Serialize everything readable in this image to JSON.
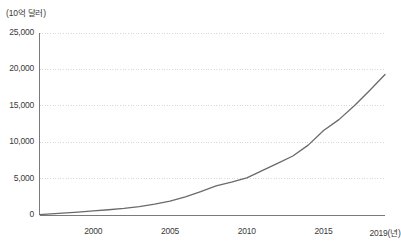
{
  "chart_data": {
    "type": "line",
    "title": "",
    "subtitle": "",
    "unit_label": "(10억 달러)",
    "xlabel": "2019(년)",
    "ylabel": "(10억 달러)",
    "xlim": [
      1996.5,
      2019
    ],
    "ylim": [
      0,
      25000
    ],
    "grid": true,
    "legend": "none",
    "y_ticks": [
      {
        "value": 0,
        "label": "0"
      },
      {
        "value": 5000,
        "label": "5,000"
      },
      {
        "value": 10000,
        "label": "10,000"
      },
      {
        "value": 15000,
        "label": "15,000"
      },
      {
        "value": 20000,
        "label": "20,000"
      },
      {
        "value": 25000,
        "label": "25,000"
      }
    ],
    "x_ticks": [
      {
        "value": 2000,
        "label": "2000"
      },
      {
        "value": 2005,
        "label": "2005"
      },
      {
        "value": 2010,
        "label": "2010"
      },
      {
        "value": 2015,
        "label": "2015"
      },
      {
        "value": 2019,
        "label": "2019(년)"
      }
    ],
    "series": [
      {
        "name": "",
        "color": "#6a6a6a",
        "x": [
          1996.5,
          1997,
          1998,
          1999,
          2000,
          2001,
          2002,
          2003,
          2004,
          2005,
          2006,
          2007,
          2008,
          2009,
          2010,
          2011,
          2012,
          2013,
          2014,
          2015,
          2016,
          2017,
          2018,
          2019
        ],
        "values": [
          60,
          120,
          250,
          400,
          560,
          720,
          900,
          1150,
          1500,
          1900,
          2500,
          3200,
          4000,
          4500,
          5100,
          6100,
          7100,
          8100,
          9600,
          11600,
          13100,
          15000,
          17100,
          19300
        ]
      }
    ],
    "colors": {
      "line": "#6a6a6a",
      "axis": "#7a7a7a",
      "grid": "#d9d9d9",
      "text": "#3a3a3a",
      "background": "#ffffff"
    }
  }
}
